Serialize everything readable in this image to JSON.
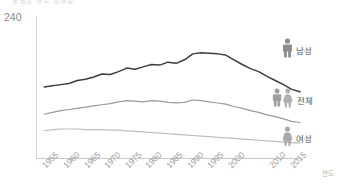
{
  "title_clipped": "통계로 보는 흡연율",
  "axis": {
    "y_tick_label": "240",
    "x_axis_name": "연도",
    "x_tick_labels": [
      "1955",
      "1960",
      "1965",
      "1970",
      "1975",
      "1980",
      "1985",
      "1990",
      "1995",
      "2000",
      "2010",
      "2015"
    ]
  },
  "legend": {
    "male": {
      "label": "남성",
      "icon": "male-person-icon",
      "color": "#3d3d3d"
    },
    "total": {
      "label": "전체",
      "icon": "male-female-pair-icon",
      "color": "#9b9b9b"
    },
    "female": {
      "label": "여성",
      "icon": "female-person-icon",
      "color": "#bdbdbd"
    }
  },
  "chart_data": {
    "type": "line",
    "title": "통계로 보는 흡연율",
    "xlabel": "연도",
    "ylabel": "",
    "ylim": [
      0,
      240
    ],
    "xlim": [
      1953,
      2017
    ],
    "grid": false,
    "legend_position": "right",
    "x": [
      1955,
      1957,
      1959,
      1961,
      1963,
      1965,
      1967,
      1969,
      1971,
      1973,
      1975,
      1977,
      1979,
      1981,
      1983,
      1985,
      1987,
      1989,
      1991,
      1993,
      1995,
      1997,
      1999,
      2001,
      2003,
      2005,
      2007,
      2009,
      2011,
      2013,
      2015,
      2017
    ],
    "series": [
      {
        "name": "남성",
        "color": "#3d3d3d",
        "values": [
          120,
          122,
          124,
          126,
          131,
          133,
          137,
          142,
          141,
          146,
          152,
          150,
          154,
          158,
          157,
          162,
          160,
          166,
          176,
          178,
          177,
          176,
          174,
          166,
          158,
          151,
          146,
          138,
          131,
          124,
          116,
          112
        ]
      },
      {
        "name": "전체",
        "color": "#9b9b9b",
        "values": [
          74,
          77,
          80,
          82,
          84,
          86,
          88,
          90,
          92,
          95,
          97,
          96,
          95,
          97,
          96,
          94,
          93,
          94,
          98,
          97,
          95,
          93,
          91,
          87,
          84,
          80,
          77,
          73,
          70,
          66,
          62,
          60
        ]
      },
      {
        "name": "여성",
        "color": "#bdbdbd",
        "values": [
          46,
          48,
          49,
          49,
          49,
          48,
          48,
          48,
          47,
          47,
          46,
          45,
          44,
          43,
          42,
          41,
          40,
          39,
          38,
          37,
          36,
          35,
          34,
          33,
          32,
          31,
          30,
          29,
          28,
          27,
          26,
          25
        ]
      }
    ]
  }
}
